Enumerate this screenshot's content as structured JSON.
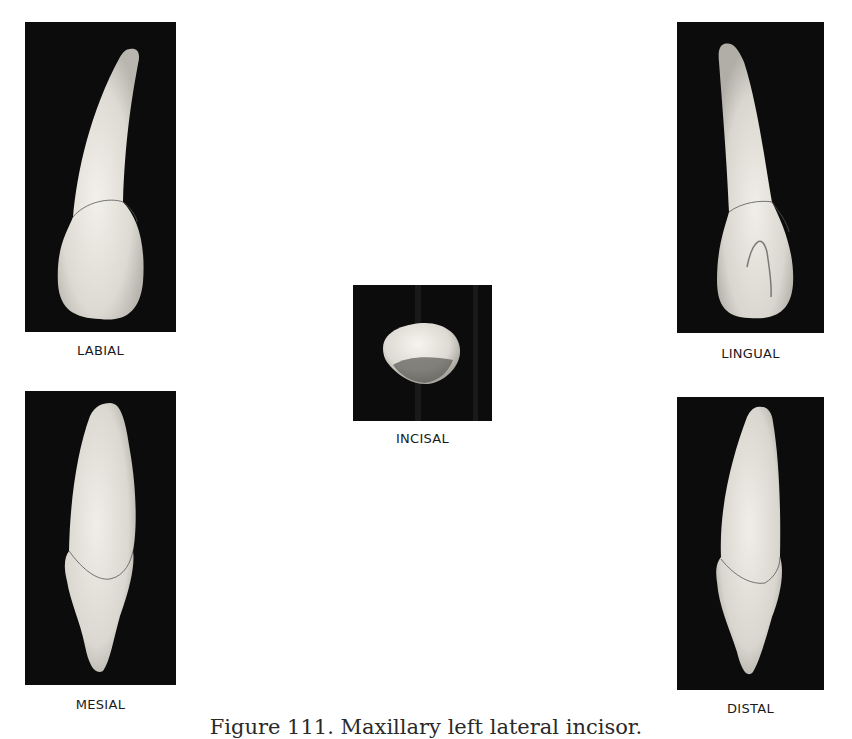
{
  "figure": {
    "caption": "Figure 111. Maxillary left lateral incisor.",
    "views": {
      "labial": {
        "label": "LABIAL"
      },
      "lingual": {
        "label": "LINGUAL"
      },
      "incisal": {
        "label": "INCISAL"
      },
      "mesial": {
        "label": "MESIAL"
      },
      "distal": {
        "label": "DISTAL"
      }
    }
  },
  "colors": {
    "photo_background": "#0c0c0c",
    "tooth": "#e8e6df",
    "page": "#ffffff"
  }
}
